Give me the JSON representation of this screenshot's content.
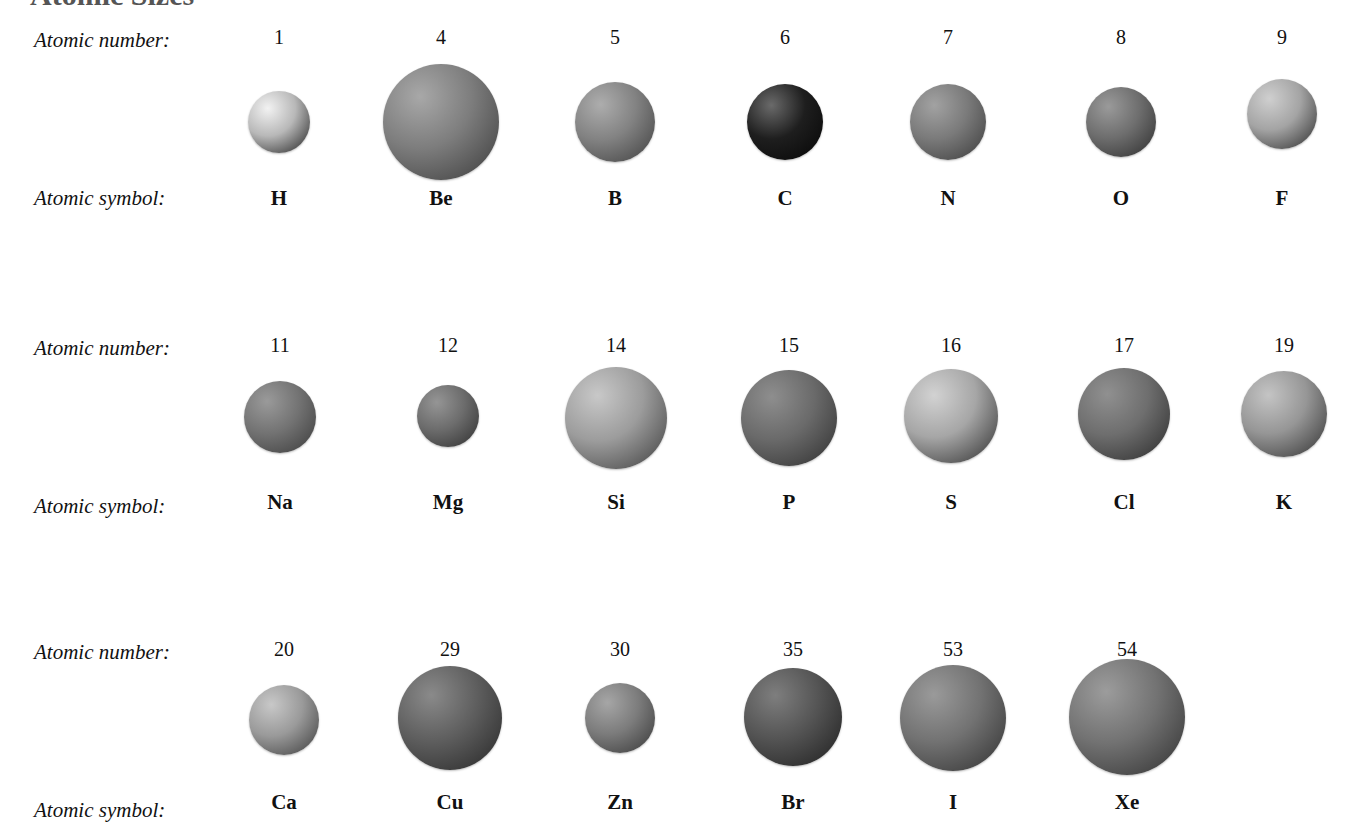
{
  "title": "Atomic Sizes",
  "labels": {
    "number": "Atomic number:",
    "symbol": "Atomic symbol:"
  },
  "rows": [
    {
      "label_number_y": 28,
      "label_symbol_y": 186,
      "number_y": 26,
      "symbol_y": 186,
      "elements": [
        {
          "number": "1",
          "symbol": "H",
          "x": 279,
          "cy": 122,
          "r": 31,
          "tone": "#b8b8b8",
          "light": "#f2f2f2",
          "dark": "#1e1e1e"
        },
        {
          "number": "4",
          "symbol": "Be",
          "x": 441,
          "cy": 122,
          "r": 58,
          "tone": "#7d7d7d",
          "light": "#a8a8a8",
          "dark": "#3a3a3a"
        },
        {
          "number": "5",
          "symbol": "B",
          "x": 615,
          "cy": 122,
          "r": 40,
          "tone": "#828282",
          "light": "#adadad",
          "dark": "#3e3e3e"
        },
        {
          "number": "6",
          "symbol": "C",
          "x": 785,
          "cy": 122,
          "r": 38,
          "tone": "#1e1e1e",
          "light": "#6a6a6a",
          "dark": "#050505"
        },
        {
          "number": "7",
          "symbol": "N",
          "x": 948,
          "cy": 122,
          "r": 38,
          "tone": "#7a7a7a",
          "light": "#a2a2a2",
          "dark": "#3a3a3a"
        },
        {
          "number": "8",
          "symbol": "O",
          "x": 1121,
          "cy": 122,
          "r": 35,
          "tone": "#6e6e6e",
          "light": "#9a9a9a",
          "dark": "#2c2c2c"
        },
        {
          "number": "9",
          "symbol": "F",
          "x": 1282,
          "cy": 114,
          "r": 35,
          "tone": "#a4a4a4",
          "light": "#cfcfcf",
          "dark": "#2a2a2a"
        }
      ]
    },
    {
      "label_number_y": 336,
      "label_symbol_y": 494,
      "number_y": 334,
      "symbol_y": 490,
      "elements": [
        {
          "number": "11",
          "symbol": "Na",
          "x": 280,
          "cy": 417,
          "r": 36,
          "tone": "#737373",
          "light": "#9a9a9a",
          "dark": "#3a3a3a"
        },
        {
          "number": "12",
          "symbol": "Mg",
          "x": 448,
          "cy": 416,
          "r": 31,
          "tone": "#6c6c6c",
          "light": "#959595",
          "dark": "#2e2e2e"
        },
        {
          "number": "14",
          "symbol": "Si",
          "x": 616,
          "cy": 418,
          "r": 51,
          "tone": "#9c9c9c",
          "light": "#c8c8c8",
          "dark": "#3c3c3c"
        },
        {
          "number": "15",
          "symbol": "P",
          "x": 789,
          "cy": 418,
          "r": 48,
          "tone": "#6a6a6a",
          "light": "#8e8e8e",
          "dark": "#2e2e2e"
        },
        {
          "number": "16",
          "symbol": "S",
          "x": 951,
          "cy": 416,
          "r": 47,
          "tone": "#a6a6a6",
          "light": "#d2d2d2",
          "dark": "#2c2c2c"
        },
        {
          "number": "17",
          "symbol": "Cl",
          "x": 1124,
          "cy": 414,
          "r": 46,
          "tone": "#6e6e6e",
          "light": "#909090",
          "dark": "#2a2a2a"
        },
        {
          "number": "19",
          "symbol": "K",
          "x": 1284,
          "cy": 414,
          "r": 43,
          "tone": "#969696",
          "light": "#c4c4c4",
          "dark": "#303030"
        }
      ]
    },
    {
      "label_number_y": 640,
      "label_symbol_y": 798,
      "number_y": 638,
      "symbol_y": 790,
      "elements": [
        {
          "number": "20",
          "symbol": "Ca",
          "x": 284,
          "cy": 720,
          "r": 35,
          "tone": "#9a9a9a",
          "light": "#c8c8c8",
          "dark": "#3a3a3a"
        },
        {
          "number": "29",
          "symbol": "Cu",
          "x": 450,
          "cy": 718,
          "r": 52,
          "tone": "#5e5e5e",
          "light": "#8a8a8a",
          "dark": "#262626"
        },
        {
          "number": "30",
          "symbol": "Zn",
          "x": 620,
          "cy": 718,
          "r": 35,
          "tone": "#7c7c7c",
          "light": "#a6a6a6",
          "dark": "#363636"
        },
        {
          "number": "35",
          "symbol": "Br",
          "x": 793,
          "cy": 717,
          "r": 49,
          "tone": "#545454",
          "light": "#7e7e7e",
          "dark": "#1e1e1e"
        },
        {
          "number": "53",
          "symbol": "I",
          "x": 953,
          "cy": 718,
          "r": 53,
          "tone": "#727272",
          "light": "#9a9a9a",
          "dark": "#303030"
        },
        {
          "number": "54",
          "symbol": "Xe",
          "x": 1127,
          "cy": 717,
          "r": 58,
          "tone": "#727272",
          "light": "#9c9c9c",
          "dark": "#303030"
        }
      ]
    }
  ]
}
